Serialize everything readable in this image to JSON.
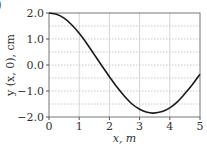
{
  "panel_label": ")",
  "chart_data": {
    "type": "line",
    "title": "",
    "xlabel": "x, m",
    "ylabel": "y (x, 0), cm",
    "xlim": [
      0,
      5
    ],
    "ylim": [
      -2.0,
      2.0
    ],
    "x_ticks": [
      "0",
      "1",
      "2",
      "3",
      "4",
      "5"
    ],
    "y_ticks": [
      "2.0",
      "1.0",
      "0.0",
      "−1.0",
      "−2.0"
    ],
    "grid": {
      "vertical": "solid at integer x",
      "horizontal": "dotted every 0.5 cm"
    },
    "series": [
      {
        "name": "y(x,0)",
        "color": "#1a1a1a",
        "x": [
          0,
          0.25,
          0.5,
          0.75,
          1.0,
          1.25,
          1.5,
          1.75,
          2.0,
          2.25,
          2.5,
          2.75,
          3.0,
          3.25,
          3.45,
          3.75,
          4.0,
          4.25,
          4.5,
          4.75,
          5.0
        ],
        "y": [
          2.0,
          1.95,
          1.8,
          1.55,
          1.22,
          0.83,
          0.4,
          -0.03,
          -0.45,
          -0.85,
          -1.2,
          -1.5,
          -1.7,
          -1.82,
          -1.85,
          -1.79,
          -1.65,
          -1.42,
          -1.1,
          -0.75,
          -0.35
        ]
      }
    ]
  }
}
